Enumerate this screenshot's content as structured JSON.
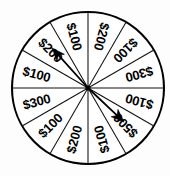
{
  "figure": {
    "name": "prize-spinner-wheel",
    "background_color": "#fdfdfd",
    "ink_color": "#000000"
  },
  "wheel": {
    "center_x": 88,
    "center_y": 88,
    "radius": 76,
    "sector_count": 12,
    "sector_angle_degrees": 30,
    "rim_color": "#000000",
    "face_color": "#ffffff",
    "sectors": [
      {
        "index": 0,
        "label": "$200",
        "start_angle": 0,
        "end_angle": 30,
        "mid_angle": 15
      },
      {
        "index": 1,
        "label": "$100",
        "start_angle": 30,
        "end_angle": 60,
        "mid_angle": 45
      },
      {
        "index": 2,
        "label": "$300",
        "start_angle": 60,
        "end_angle": 90,
        "mid_angle": 75
      },
      {
        "index": 3,
        "label": "$100",
        "start_angle": 90,
        "end_angle": 120,
        "mid_angle": 105
      },
      {
        "index": 4,
        "label": "$500",
        "start_angle": 120,
        "end_angle": 150,
        "mid_angle": 135
      },
      {
        "index": 5,
        "label": "$100",
        "start_angle": 150,
        "end_angle": 180,
        "mid_angle": 165
      },
      {
        "index": 6,
        "label": "$200",
        "start_angle": 180,
        "end_angle": 210,
        "mid_angle": 195
      },
      {
        "index": 7,
        "label": "$100",
        "start_angle": 210,
        "end_angle": 240,
        "mid_angle": 225
      },
      {
        "index": 8,
        "label": "$300",
        "start_angle": 240,
        "end_angle": 270,
        "mid_angle": 255
      },
      {
        "index": 9,
        "label": "$100",
        "start_angle": 270,
        "end_angle": 300,
        "mid_angle": 285
      },
      {
        "index": 10,
        "label": "$200",
        "start_angle": 300,
        "end_angle": 330,
        "mid_angle": 315
      },
      {
        "index": 11,
        "label": "$100",
        "start_angle": 330,
        "end_angle": 360,
        "mid_angle": 345
      }
    ]
  },
  "pointers": [
    {
      "name": "upper-left-pointer",
      "target_label": "$200",
      "angle_degrees": 312,
      "tail_x": 88,
      "tail_y": 88,
      "tip_x": 52,
      "tip_y": 48
    },
    {
      "name": "lower-right-pointer",
      "target_label": "$500",
      "angle_degrees": 128,
      "tail_x": 88,
      "tail_y": 88,
      "tip_x": 124,
      "tip_y": 122
    }
  ]
}
